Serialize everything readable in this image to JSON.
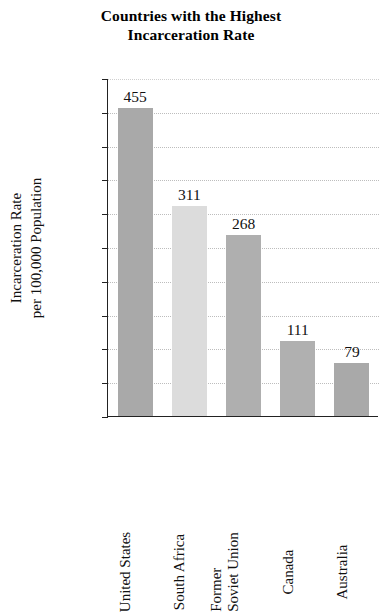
{
  "chart_data": {
    "type": "bar",
    "title": "Countries with the Highest Incarceration Rate",
    "title_lines": [
      "Countries with the Highest",
      "Incarceration Rate"
    ],
    "xlabel": "",
    "ylabel": "Incarceration Rate per 100,000 Population",
    "ylabel_lines": [
      "Incarceration Rate",
      "per 100,000 Population"
    ],
    "categories": [
      "United States",
      "South Africa",
      "Former Soviet Union",
      "Canada",
      "Australia"
    ],
    "category_lines": [
      [
        "United States"
      ],
      [
        "South Africa"
      ],
      [
        "Former",
        "Soviet Union"
      ],
      [
        "Canada"
      ],
      [
        "Australia"
      ]
    ],
    "values": [
      455,
      311,
      268,
      111,
      79
    ],
    "value_labels": [
      "455",
      "311",
      "268",
      "111",
      "79"
    ],
    "bar_colors": [
      "#a9a9a9",
      "#dcdcdc",
      "#afafaf",
      "#b0b0b0",
      "#a9a9a9"
    ],
    "ylim": [
      0,
      500
    ],
    "ytick_step": 50,
    "yticks": [
      0,
      50,
      100,
      150,
      200,
      250,
      300,
      350,
      400,
      450,
      500
    ],
    "ytick_labels": [
      "0",
      "50",
      "100",
      "150",
      "200",
      "250",
      "300",
      "350",
      "400",
      "450",
      "500"
    ],
    "grid": true,
    "grid_color": "#bdbdbd",
    "grid_style": "dotted",
    "legend": null,
    "axis_color": "#222222",
    "background": "#ffffff"
  }
}
